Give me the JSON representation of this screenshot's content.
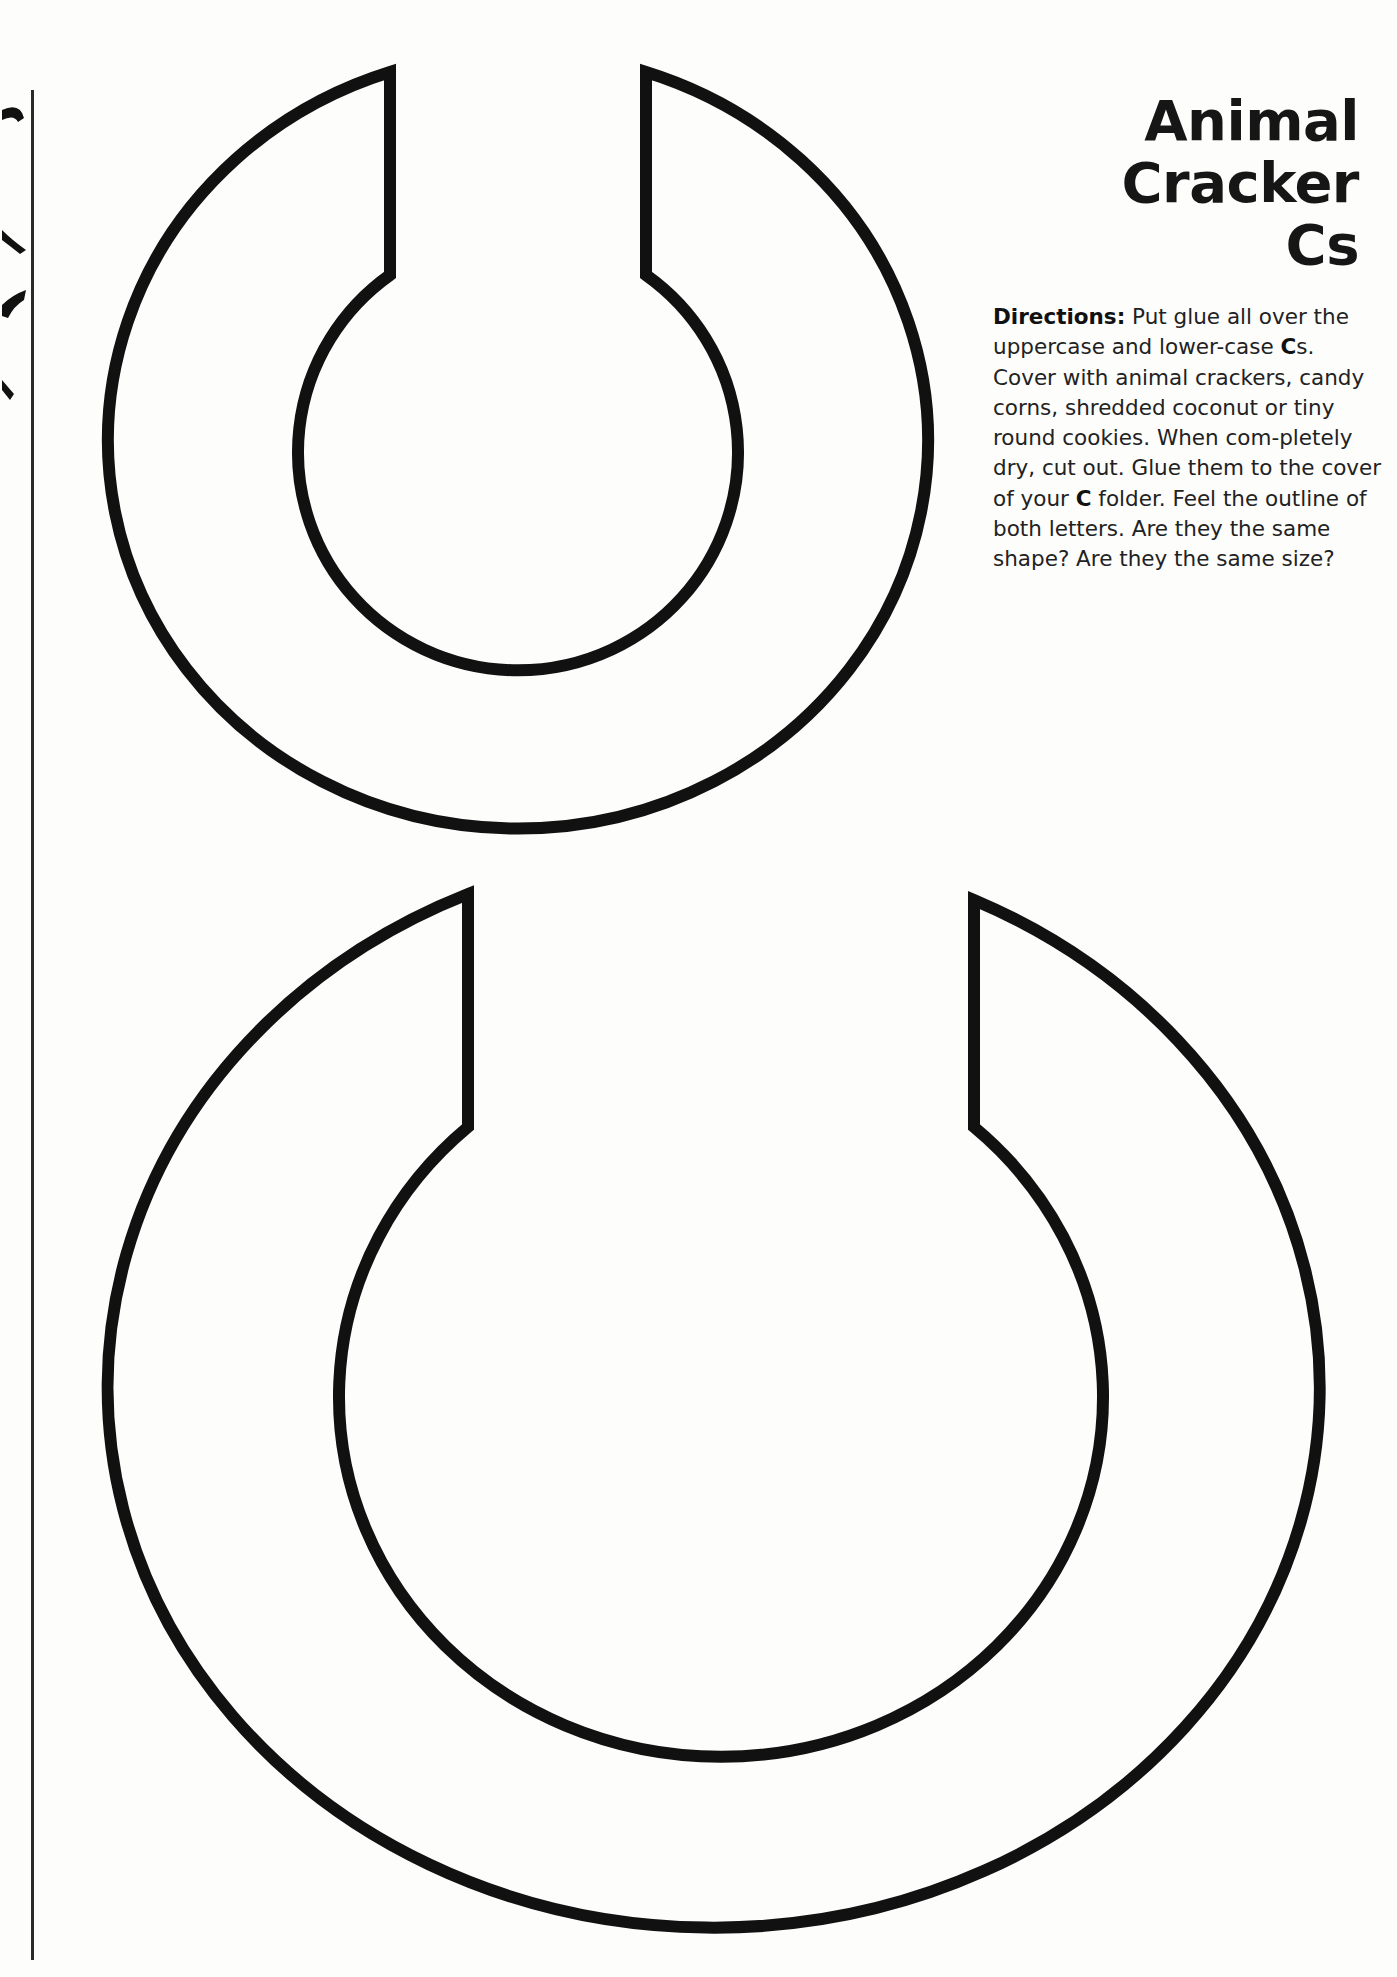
{
  "page": {
    "title_lines": [
      "Animal",
      "Cracker",
      "Cs"
    ],
    "directions": {
      "label": "Directions:",
      "segments": [
        {
          "text": "  Put glue all over the uppercase and lower-case ",
          "bold": false
        },
        {
          "text": "C",
          "bold": true
        },
        {
          "text": "s.  Cover with animal crackers, candy corns, shredded coconut or tiny round cookies.  When com-pletely dry, cut out.  Glue them to the cover of your ",
          "bold": false
        },
        {
          "text": "C",
          "bold": true
        },
        {
          "text": " folder.  Feel the outline of both letters.  Are they the same shape?  Are they the same size?",
          "bold": false
        }
      ]
    }
  },
  "shapes": [
    {
      "name": "lowercase-c-outline",
      "label": "lowercase c"
    },
    {
      "name": "uppercase-c-outline",
      "label": "uppercase C"
    }
  ],
  "colors": {
    "ink": "#111111",
    "paper": "#fdfdfc"
  }
}
